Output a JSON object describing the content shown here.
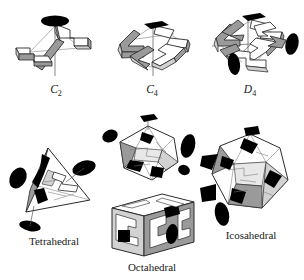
{
  "figure": {
    "background_color": "#ffffff",
    "ink_color": "#2b2b2b",
    "marker_color": "#000000",
    "shade_mid": "#9a9a9a",
    "shade_light": "#d2d2d2",
    "panels": [
      {
        "id": "c2",
        "label": "C",
        "subscript": "2",
        "label_full": "C2",
        "row": "top",
        "column": 1,
        "symmetry_order": 2,
        "axis_marker": "ellipse",
        "axis_marker_name": "two-fold-axis-lens",
        "subunit_count": 2,
        "subunit_shape": "zigzag-bar",
        "caption_italic": true
      },
      {
        "id": "c4",
        "label": "C",
        "subscript": "4",
        "label_full": "C4",
        "row": "top",
        "column": 2,
        "symmetry_order": 4,
        "axis_marker": "square",
        "axis_marker_name": "four-fold-axis-square",
        "subunit_count": 4,
        "subunit_shape": "zigzag-bar",
        "caption_italic": true
      },
      {
        "id": "d4",
        "label": "D",
        "subscript": "4",
        "label_full": "D4",
        "row": "top",
        "column": 3,
        "symmetry_order": 8,
        "axis_marker": "square",
        "axis_marker_name": "four-fold-axis-square",
        "secondary_markers": "two-fold-axis-lens",
        "subunit_count": 8,
        "subunit_shape": "zigzag-bar",
        "caption_italic": true
      },
      {
        "id": "tetrahedral",
        "label": "Tetrahedral",
        "subscript": "",
        "label_full": "Tetrahedral",
        "row": "bottom",
        "column": 1,
        "symmetry_order": 12,
        "axis_marker": "ellipse",
        "axis_marker_name": "three-fold-axis-triangle",
        "subunit_count": 12,
        "subunit_shape": "zigzag-bar",
        "caption_italic": false
      },
      {
        "id": "octahedral",
        "label": "Octahedral",
        "subscript": "",
        "label_full": "Octahedral",
        "row": "bottom",
        "column": 2,
        "symmetry_order": 24,
        "axis_marker": "square",
        "axis_marker_name": "four-fold-axis-square",
        "subunit_count": 24,
        "subunit_shape": "zigzag-bar",
        "caption_italic": false,
        "sub_panels": [
          "cuboctahedron-view",
          "cube-view"
        ]
      },
      {
        "id": "icosahedral",
        "label": "Icosahedral",
        "subscript": "",
        "label_full": "Icosahedral",
        "row": "bottom",
        "column": 3,
        "symmetry_order": 60,
        "axis_marker": "pentagon",
        "axis_marker_name": "five-fold-axis-pentagon",
        "subunit_count": 60,
        "subunit_shape": "zigzag-bar",
        "caption_italic": false
      }
    ]
  }
}
